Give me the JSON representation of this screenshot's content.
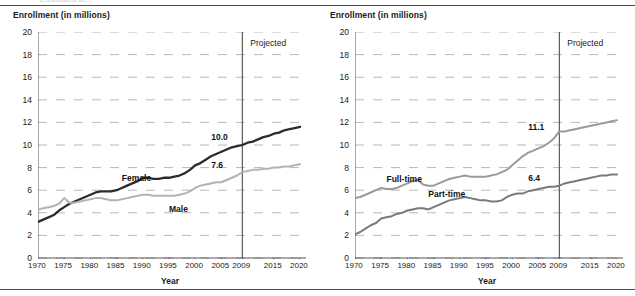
{
  "document": {
    "clipped_header_text": "Enrollment in..."
  },
  "charts": [
    {
      "id": "enrollment-by-sex",
      "y_axis_title": "Enrollment (in millions)",
      "x_axis_title": "Year",
      "projected_label": "Projected",
      "projection_start_year": 2009,
      "series_labels": {
        "dark": "Female",
        "light": "Male"
      },
      "value_labels": {
        "dark": "10.0",
        "light": "7.6"
      }
    },
    {
      "id": "enrollment-by-attendance",
      "y_axis_title": "Enrollment (in millions)",
      "x_axis_title": "Year",
      "projected_label": "Projected",
      "projection_start_year": 2009,
      "series_labels": {
        "upper": "Full-time",
        "lower": "Part-time"
      },
      "value_labels": {
        "upper": "11.1",
        "lower": "6.4"
      }
    }
  ],
  "colors": {
    "dark_series": "#2b2b2b",
    "light_series": "#b3b3b3",
    "mid_series": "#8a8a8a",
    "gridline": "#b8b8b8",
    "axis": "#555555",
    "text": "#1a1a1a",
    "rule": "#4d4d4d"
  },
  "chart_data": [
    {
      "type": "line",
      "title": "Enrollment (in millions) by sex",
      "xlabel": "Year",
      "ylabel": "Enrollment (in millions)",
      "xlim": [
        1970,
        2020
      ],
      "ylim": [
        0,
        20
      ],
      "ytick_step": 2,
      "yticks": [
        0,
        2,
        4,
        6,
        8,
        10,
        12,
        14,
        16,
        18,
        20
      ],
      "xticks": [
        1970,
        1975,
        1980,
        1985,
        1990,
        1995,
        2000,
        2005,
        2009,
        2015,
        2020
      ],
      "grid": "horizontal-dashed",
      "legend": "inline-annotations",
      "annotations": [
        {
          "text": "Projected",
          "x": 2010.5,
          "y": 19.0
        },
        {
          "text": "Female",
          "x": 1986,
          "y": 7.1
        },
        {
          "text": "Male",
          "x": 1995,
          "y": 4.3
        },
        {
          "text": "10.0",
          "x": 2006.5,
          "y": 10.7
        },
        {
          "text": "7.6",
          "x": 2006.5,
          "y": 8.2
        }
      ],
      "projection_start": 2009,
      "x": [
        1970,
        1971,
        1972,
        1973,
        1974,
        1975,
        1976,
        1977,
        1978,
        1979,
        1980,
        1981,
        1982,
        1983,
        1984,
        1985,
        1986,
        1987,
        1988,
        1989,
        1990,
        1991,
        1992,
        1993,
        1994,
        1995,
        1996,
        1997,
        1998,
        1999,
        2000,
        2001,
        2002,
        2003,
        2004,
        2005,
        2006,
        2007,
        2008,
        2009,
        2010,
        2011,
        2012,
        2013,
        2014,
        2015,
        2016,
        2017,
        2018,
        2019,
        2020
      ],
      "series": [
        {
          "name": "Female",
          "color": "#2b2b2b",
          "values": [
            3.2,
            3.4,
            3.6,
            3.8,
            4.2,
            4.5,
            4.8,
            5.0,
            5.2,
            5.4,
            5.6,
            5.8,
            5.9,
            5.9,
            5.9,
            6.0,
            6.2,
            6.4,
            6.6,
            6.8,
            7.1,
            7.1,
            7.0,
            7.0,
            7.1,
            7.1,
            7.2,
            7.3,
            7.5,
            7.8,
            8.2,
            8.4,
            8.7,
            9.0,
            9.2,
            9.4,
            9.6,
            9.8,
            9.9,
            10.0,
            10.2,
            10.3,
            10.5,
            10.7,
            10.8,
            11.0,
            11.1,
            11.3,
            11.4,
            11.5,
            11.6
          ]
        },
        {
          "name": "Male",
          "color": "#b3b3b3",
          "values": [
            4.3,
            4.4,
            4.5,
            4.6,
            4.8,
            5.3,
            4.9,
            4.9,
            5.0,
            5.1,
            5.2,
            5.3,
            5.3,
            5.2,
            5.1,
            5.1,
            5.2,
            5.3,
            5.4,
            5.5,
            5.6,
            5.6,
            5.5,
            5.5,
            5.5,
            5.5,
            5.5,
            5.6,
            5.7,
            5.9,
            6.2,
            6.4,
            6.5,
            6.6,
            6.7,
            6.7,
            6.9,
            7.1,
            7.3,
            7.6,
            7.7,
            7.8,
            7.8,
            7.9,
            7.9,
            8.0,
            8.0,
            8.1,
            8.1,
            8.2,
            8.3
          ]
        }
      ]
    },
    {
      "type": "line",
      "title": "Enrollment (in millions) by attendance status",
      "xlabel": "Year",
      "ylabel": "Enrollment (in millions)",
      "xlim": [
        1970,
        2020
      ],
      "ylim": [
        0,
        20
      ],
      "ytick_step": 2,
      "yticks": [
        0,
        2,
        4,
        6,
        8,
        10,
        12,
        14,
        16,
        18,
        20
      ],
      "xticks": [
        1970,
        1975,
        1980,
        1985,
        1990,
        1995,
        2000,
        2005,
        2009,
        2015,
        2020
      ],
      "grid": "horizontal-dashed",
      "legend": "inline-annotations",
      "annotations": [
        {
          "text": "Projected",
          "x": 2010.5,
          "y": 19.0
        },
        {
          "text": "Full-time",
          "x": 1976,
          "y": 7.0
        },
        {
          "text": "Part-time",
          "x": 1984,
          "y": 5.7
        },
        {
          "text": "11.1",
          "x": 2006.5,
          "y": 11.6
        },
        {
          "text": "6.4",
          "x": 2006.5,
          "y": 7.1
        }
      ],
      "projection_start": 2009,
      "x": [
        1970,
        1971,
        1972,
        1973,
        1974,
        1975,
        1976,
        1977,
        1978,
        1979,
        1980,
        1981,
        1982,
        1983,
        1984,
        1985,
        1986,
        1987,
        1988,
        1989,
        1990,
        1991,
        1992,
        1993,
        1994,
        1995,
        1996,
        1997,
        1998,
        1999,
        2000,
        2001,
        2002,
        2003,
        2004,
        2005,
        2006,
        2007,
        2008,
        2009,
        2010,
        2011,
        2012,
        2013,
        2014,
        2015,
        2016,
        2017,
        2018,
        2019,
        2020
      ],
      "series": [
        {
          "name": "Full-time",
          "color": "#9a9a9a",
          "values": [
            5.3,
            5.4,
            5.6,
            5.8,
            6.0,
            6.2,
            6.1,
            6.1,
            6.2,
            6.4,
            6.6,
            6.8,
            6.9,
            6.5,
            6.4,
            6.4,
            6.6,
            6.8,
            7.0,
            7.1,
            7.2,
            7.3,
            7.2,
            7.2,
            7.2,
            7.2,
            7.3,
            7.4,
            7.6,
            7.8,
            8.2,
            8.6,
            9.0,
            9.3,
            9.5,
            9.7,
            9.9,
            10.2,
            10.6,
            11.2,
            11.2,
            11.3,
            11.4,
            11.5,
            11.6,
            11.7,
            11.8,
            11.9,
            12.0,
            12.1,
            12.2
          ]
        },
        {
          "name": "Part-time",
          "color": "#7a7a7a",
          "values": [
            2.1,
            2.3,
            2.6,
            2.9,
            3.1,
            3.5,
            3.6,
            3.7,
            3.9,
            4.0,
            4.2,
            4.3,
            4.4,
            4.4,
            4.3,
            4.5,
            4.7,
            4.9,
            5.1,
            5.2,
            5.3,
            5.4,
            5.3,
            5.2,
            5.1,
            5.1,
            5.0,
            5.0,
            5.1,
            5.4,
            5.6,
            5.7,
            5.7,
            5.9,
            6.0,
            6.1,
            6.2,
            6.3,
            6.3,
            6.4,
            6.6,
            6.7,
            6.8,
            6.9,
            7.0,
            7.1,
            7.2,
            7.3,
            7.3,
            7.4,
            7.4
          ]
        }
      ]
    }
  ]
}
